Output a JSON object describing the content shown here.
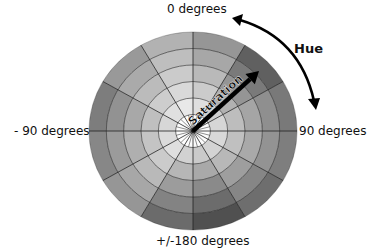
{
  "diagram": {
    "title": "",
    "labels": {
      "top": "0 degrees",
      "left": "- 90 degrees",
      "right": "90 degrees",
      "bottom": "+/-180 degrees",
      "hue": "Hue",
      "saturation": "Saturation"
    },
    "wheel": {
      "center": [
        193,
        131
      ],
      "radius_x": 104,
      "radius_y": 99,
      "rings": 6,
      "sectors": 12,
      "inner_core_divisions": 24,
      "sector_outer_colors": [
        "#8a8a8a",
        "#4e4e4e",
        "#6a6a6a",
        "#707070",
        "#5e5e5e",
        "#3c3c3c",
        "#5a5a5a",
        "#8a8a8a",
        "#7a7a7a",
        "#6e6e6e",
        "#8e8e8e",
        "#a9a9a9"
      ],
      "center_color": "#ffffff",
      "line_color": "#222222"
    },
    "arrows": {
      "saturation": {
        "from": [
          193,
          131
        ],
        "to": [
          259,
          71
        ]
      },
      "hue": {
        "from": [
          232,
          18
        ],
        "to": [
          316,
          110
        ]
      }
    }
  }
}
